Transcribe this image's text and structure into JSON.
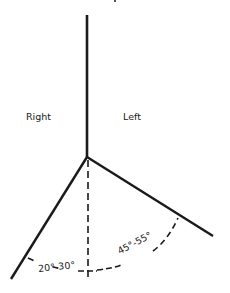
{
  "diagram": {
    "labels": {
      "right_side": "Right",
      "left_side": "Left"
    },
    "angles": {
      "lower_left_range": "20°-30°",
      "lower_right_range": "45°-55°"
    },
    "colors": {
      "line": "#1a1a1a",
      "background": "#ffffff"
    }
  }
}
